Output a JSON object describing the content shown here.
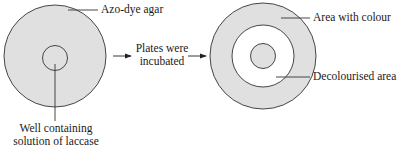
{
  "diagram": {
    "colors": {
      "agar_fill": "#e0e0e0",
      "decolourised_fill": "#ffffff",
      "stroke": "#333333",
      "text": "#1a1a1a"
    },
    "left_plate": {
      "label_agar": "Azo-dye agar",
      "label_well_line1": "Well containing",
      "label_well_line2": "solution of laccase"
    },
    "arrow": {
      "label_line1": "Plates were",
      "label_line2": "incubated"
    },
    "right_plate": {
      "label_colour": "Area with colour",
      "label_decolourised": "Decolourised area"
    }
  }
}
